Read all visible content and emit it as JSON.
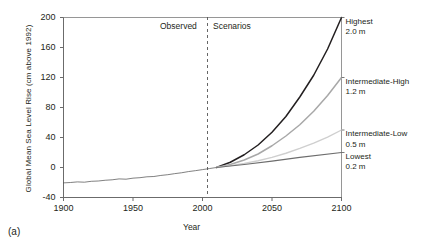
{
  "caption": "(a)",
  "chart_data": {
    "type": "line",
    "title": "",
    "xlabel": "Year",
    "ylabel": "Global Mean Sea Level Rise (cm above 1992)",
    "xlim": [
      1900,
      2100
    ],
    "ylim": [
      -40,
      200
    ],
    "xticks": [
      1900,
      1950,
      2000,
      2050,
      2100
    ],
    "yticks": [
      -40,
      0,
      40,
      80,
      120,
      160,
      200
    ],
    "grid": false,
    "legend_position": "right-inline",
    "annotations": [
      {
        "name": "observed-region",
        "text": "Observed",
        "x": 1955
      },
      {
        "name": "scenarios-region",
        "text": "Scenarios",
        "x": 2035
      },
      {
        "name": "divider",
        "text": "",
        "x": 2010,
        "style": "dashed-vertical"
      }
    ],
    "series": [
      {
        "name": "Observed",
        "label": "",
        "value_label": "",
        "color": "#4a4a4a",
        "width": 0.7,
        "x": [
          1900,
          1905,
          1910,
          1915,
          1920,
          1925,
          1930,
          1935,
          1940,
          1945,
          1950,
          1955,
          1960,
          1965,
          1970,
          1975,
          1980,
          1985,
          1990,
          1995,
          2000,
          2005,
          2010
        ],
        "values": [
          -20.5,
          -20.0,
          -19.2,
          -19.6,
          -18.4,
          -18.0,
          -17.0,
          -16.4,
          -15.2,
          -15.6,
          -14.2,
          -13.6,
          -12.4,
          -12.0,
          -10.6,
          -9.6,
          -8.2,
          -7.0,
          -5.4,
          -4.2,
          -2.8,
          -1.4,
          0.0
        ]
      },
      {
        "name": "Highest",
        "label": "Highest",
        "value_label": "2.0 m",
        "color": "#231f20",
        "width": 1.5,
        "x": [
          2010,
          2020,
          2030,
          2040,
          2050,
          2060,
          2070,
          2080,
          2090,
          2100
        ],
        "values": [
          0,
          7,
          17,
          30,
          47,
          68,
          94,
          123,
          158,
          200
        ]
      },
      {
        "name": "Intermediate-High",
        "label": "Intermediate-High",
        "value_label": "1.2 m",
        "color": "#a8a8a8",
        "width": 1.5,
        "x": [
          2010,
          2020,
          2030,
          2040,
          2050,
          2060,
          2070,
          2080,
          2090,
          2100
        ],
        "values": [
          0,
          4,
          10,
          18,
          29,
          42,
          57,
          75,
          96,
          120
        ]
      },
      {
        "name": "Intermediate-Low",
        "label": "Intermediate-Low",
        "value_label": "0.5 m",
        "color": "#cfcfcf",
        "width": 1.4,
        "x": [
          2010,
          2020,
          2030,
          2040,
          2050,
          2060,
          2070,
          2080,
          2090,
          2100
        ],
        "values": [
          0,
          2.5,
          5.5,
          9.0,
          13.5,
          19.0,
          25.5,
          32.5,
          40.5,
          50
        ]
      },
      {
        "name": "Lowest",
        "label": "Lowest",
        "value_label": "0.2 m",
        "color": "#6d6d6d",
        "width": 1.1,
        "x": [
          2010,
          2030,
          2050,
          2070,
          2100
        ],
        "values": [
          0,
          4,
          8.5,
          13.5,
          20
        ]
      }
    ]
  }
}
